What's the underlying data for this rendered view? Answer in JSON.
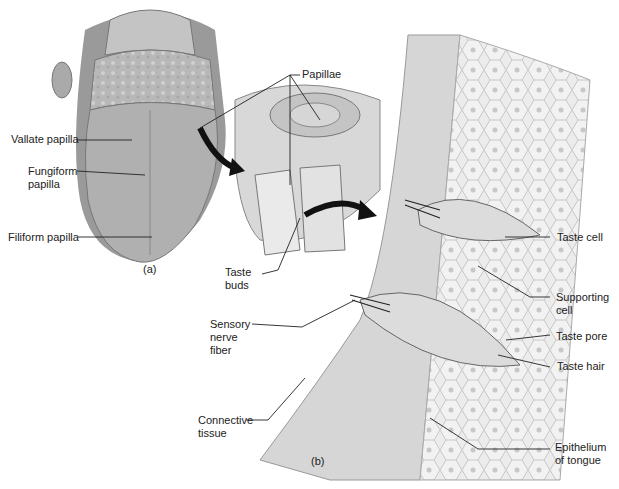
{
  "panels": {
    "a": {
      "caption": "(a)"
    },
    "b": {
      "caption": "(b)"
    }
  },
  "labels": {
    "papillae": "Papillae",
    "vallate_papilla": "Vallate papilla",
    "fungiform_papilla": "Fungiform\npapilla",
    "filiform_papilla": "Filiform papilla",
    "taste_buds": "Taste\nbuds",
    "taste_cell": "Taste cell",
    "supporting_cell": "Supporting\ncell",
    "taste_pore": "Taste pore",
    "taste_hair": "Taste hair",
    "sensory_nerve_fiber": "Sensory\nnerve\nfiber",
    "connective_tissue": "Connective\ntissue",
    "epithelium_of_tongue": "Epithelium\nof tongue"
  }
}
